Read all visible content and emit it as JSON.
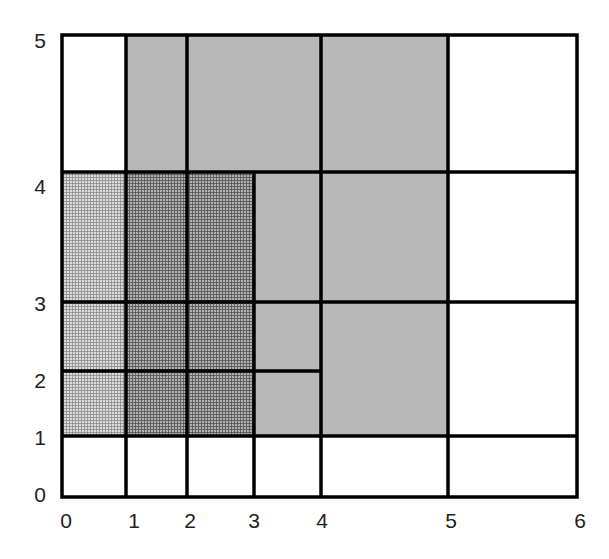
{
  "diagram": {
    "x_ticks": [
      "0",
      "1",
      "2",
      "3",
      "4",
      "5",
      "6"
    ],
    "y_ticks": [
      "0",
      "1",
      "2",
      "3",
      "4",
      "5"
    ],
    "colors": {
      "line": "#000000",
      "plain_gray": "#b8b8b8",
      "hatch_light_bg": "#d2d2d2",
      "hatch_dark_bg": "#9e9e9e",
      "white": "#ffffff"
    },
    "regions": [
      {
        "id": "r1",
        "x0": 0,
        "y0": 4,
        "x1": 1,
        "y1": 5,
        "fill": "white"
      },
      {
        "id": "r2",
        "x0": 1,
        "y0": 4,
        "x1": 2,
        "y1": 5,
        "fill": "gray"
      },
      {
        "id": "r3",
        "x0": 2,
        "y0": 4,
        "x1": 4,
        "y1": 5,
        "fill": "gray"
      },
      {
        "id": "r4",
        "x0": 4,
        "y0": 4,
        "x1": 5,
        "y1": 5,
        "fill": "gray"
      },
      {
        "id": "r5",
        "x0": 5,
        "y0": 4,
        "x1": 6,
        "y1": 5,
        "fill": "white"
      },
      {
        "id": "r6",
        "x0": 0,
        "y0": 1,
        "x1": 1,
        "y1": 4,
        "fill": "hatch-light"
      },
      {
        "id": "r7",
        "x0": 1,
        "y0": 1,
        "x1": 3,
        "y1": 4,
        "fill": "hatch-dark"
      },
      {
        "id": "r8",
        "x0": 3,
        "y0": 1,
        "x1": 5,
        "y1": 4,
        "fill": "gray"
      },
      {
        "id": "r9",
        "x0": 5,
        "y0": 1,
        "x1": 6,
        "y1": 4,
        "fill": "white"
      },
      {
        "id": "r10",
        "x0": 0,
        "y0": 0,
        "x1": 6,
        "y1": 1,
        "fill": "white"
      }
    ]
  }
}
